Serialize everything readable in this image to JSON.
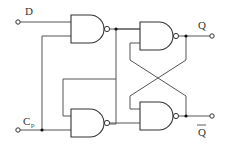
{
  "diagram": {
    "type": "logic-circuit",
    "labels": {
      "d": "D",
      "cp_main": "C",
      "cp_sub": "p",
      "q": "Q",
      "q_bar": "Q"
    },
    "gates": [
      {
        "id": "G1",
        "type": "NAND",
        "inputs": [
          "D",
          "G3.out"
        ],
        "output": "G1.out"
      },
      {
        "id": "G2",
        "type": "NAND",
        "inputs": [
          "G1.out",
          "G4.out"
        ],
        "output": "Q"
      },
      {
        "id": "G3",
        "type": "NAND",
        "inputs": [
          "G1.out",
          "Cp"
        ],
        "output": "G3.out"
      },
      {
        "id": "G4",
        "type": "NAND",
        "inputs": [
          "Q",
          "G3.out"
        ],
        "output": "Q_bar"
      }
    ],
    "colors": {
      "line": "#333333",
      "background": "#ffffff"
    }
  }
}
